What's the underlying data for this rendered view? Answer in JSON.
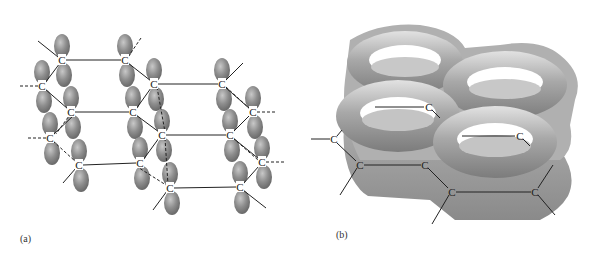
{
  "figure": {
    "panels": [
      {
        "id": "a",
        "label": "(a)",
        "description": "p-orbital lobes on carbon atoms of stacked graphite-like hexagonal rings",
        "atom_symbol": "C",
        "atoms": [
          {
            "x": 62,
            "y": 60
          },
          {
            "x": 125,
            "y": 60
          },
          {
            "x": 42,
            "y": 86
          },
          {
            "x": 154,
            "y": 84
          },
          {
            "x": 71,
            "y": 112
          },
          {
            "x": 133,
            "y": 112
          },
          {
            "x": 50,
            "y": 138
          },
          {
            "x": 162,
            "y": 135
          },
          {
            "x": 79,
            "y": 165
          },
          {
            "x": 140,
            "y": 163
          },
          {
            "x": 170,
            "y": 188
          },
          {
            "x": 222,
            "y": 84
          },
          {
            "x": 253,
            "y": 112
          },
          {
            "x": 230,
            "y": 135
          },
          {
            "x": 262,
            "y": 162
          },
          {
            "x": 240,
            "y": 187
          }
        ]
      },
      {
        "id": "b",
        "label": "(b)",
        "description": "delocalized pi-electron torus clouds above and below the hexagonal carbon rings",
        "atom_symbol": "C",
        "atoms": [
          {
            "x": 334,
            "y": 139
          },
          {
            "x": 360,
            "y": 165
          },
          {
            "x": 425,
            "y": 165
          },
          {
            "x": 452,
            "y": 192
          },
          {
            "x": 535,
            "y": 192
          },
          {
            "x": 429,
            "y": 107
          },
          {
            "x": 520,
            "y": 136
          }
        ]
      }
    ],
    "colors": {
      "lobe": "#8a8a8a",
      "lobe_highlight": "#c4c4c4",
      "torus": "#9c9c9c",
      "torus_highlight": "#dcdcdc",
      "bond": "#222222"
    }
  }
}
